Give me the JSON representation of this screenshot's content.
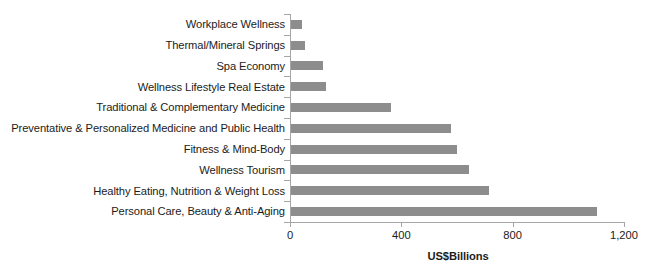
{
  "chart_data": {
    "type": "bar",
    "orientation": "horizontal",
    "title": "",
    "xlabel": "US$Billions",
    "ylabel": "",
    "xlim": [
      0,
      1200
    ],
    "xticks": [
      "0",
      "400",
      "800",
      "1,200"
    ],
    "xtick_values": [
      0,
      400,
      800,
      1200
    ],
    "grid": false,
    "legend": false,
    "bar_color": "#8d8d8d",
    "axis_color": "#a6a6a6",
    "categories": [
      "Workplace Wellness",
      "Thermal/Mineral Springs",
      "Spa Economy",
      "Wellness Lifestyle Real Estate",
      "Traditional & Complementary Medicine",
      "Preventative & Personalized Medicine and Public Health",
      "Fitness & Mind-Body",
      "Wellness Tourism",
      "Healthy Eating, Nutrition & Weight Loss",
      "Personal Care, Beauty & Anti-Aging"
    ],
    "values": [
      40,
      50,
      115,
      125,
      360,
      575,
      595,
      640,
      710,
      1100
    ]
  }
}
